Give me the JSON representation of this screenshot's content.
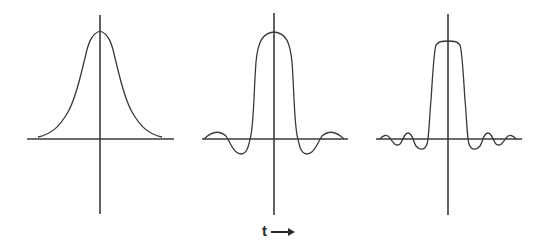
{
  "figure": {
    "axis_label": "t",
    "axis_arrow": "right-arrow",
    "line_color": "#3a3a3a",
    "background": "#ffffff"
  },
  "panels": [
    {
      "name": "gaussian-pulse",
      "shape": "smooth bell curve, no ringing"
    },
    {
      "name": "sinc-like-pulse",
      "shape": "main lobe with one pair of side lobes"
    },
    {
      "name": "narrow-sinc-pulse",
      "shape": "narrower main lobe with multiple small side lobes"
    }
  ]
}
